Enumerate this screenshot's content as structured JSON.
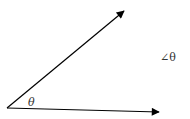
{
  "diagram": {
    "type": "angle",
    "vertex": {
      "x": 7,
      "y": 108
    },
    "rays": [
      {
        "name": "upper-ray",
        "end": {
          "x": 124,
          "y": 11
        }
      },
      {
        "name": "lower-ray",
        "end": {
          "x": 159,
          "y": 112
        }
      }
    ],
    "angle_label": "θ",
    "side_label": "∠θ",
    "colors": {
      "stroke": "#000000",
      "text": "#333333",
      "background": "#ffffff"
    }
  }
}
